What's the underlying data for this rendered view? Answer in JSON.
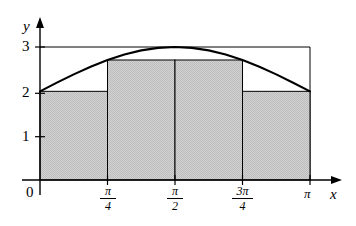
{
  "figure": {
    "kind": "riemann-sum-diagram",
    "axis_labels": {
      "x": "x",
      "y": "y"
    },
    "origin_label": "0",
    "y_ticks": [
      {
        "value": 3,
        "label": "3"
      },
      {
        "value": 2,
        "label": "2"
      },
      {
        "value": 1,
        "label": "1"
      }
    ],
    "x_ticks": [
      {
        "value": 0,
        "label": "0",
        "style": "plain"
      },
      {
        "value": 0.7853981634,
        "num": "π",
        "den": "4",
        "style": "fraction"
      },
      {
        "value": 1.5707963268,
        "num": "π",
        "den": "2",
        "style": "fraction"
      },
      {
        "value": 2.3561944902,
        "num": "3π",
        "den": "4",
        "style": "fraction"
      },
      {
        "value": 3.1415926536,
        "label": "π",
        "style": "plain"
      }
    ],
    "colors": {
      "fill": "#c8c8c8",
      "stroke": "#000000",
      "curve": "#000000",
      "thin_line": "#000000",
      "background": "#ffffff"
    }
  },
  "chart_data": {
    "type": "area",
    "title": "",
    "xlabel": "x",
    "ylabel": "y",
    "xlim": [
      0,
      3.1415926536
    ],
    "ylim": [
      0,
      3
    ],
    "grid": false,
    "legend": "none",
    "curve": {
      "name": "f(x) = 2 + sin(x)",
      "expression": "2 + sin(x)",
      "x": [
        0,
        0.19635,
        0.3927,
        0.58905,
        0.7854,
        0.98175,
        1.1781,
        1.37445,
        1.5708,
        1.76715,
        1.9635,
        2.15985,
        2.3562,
        2.55255,
        2.7489,
        2.94525,
        3.14159
      ],
      "y": [
        2.0,
        2.195,
        2.383,
        2.556,
        2.707,
        2.831,
        2.924,
        2.981,
        3.0,
        2.981,
        2.924,
        2.831,
        2.707,
        2.556,
        2.383,
        2.195,
        2.0
      ]
    },
    "rectangles": {
      "kind": "lower-riemann-sum",
      "n": 4,
      "dx": 0.7853981634,
      "edges": [
        0,
        0.7853981634,
        1.5707963268,
        2.3561944902,
        3.1415926536
      ],
      "edge_labels": [
        "0",
        "π/4",
        "π/2",
        "3π/4",
        "π"
      ],
      "heights": [
        2.0,
        2.707,
        2.707,
        2.0
      ],
      "sum_area": 3.6993
    },
    "reference_lines": [
      {
        "type": "horizontal",
        "value": 3,
        "label": "3"
      }
    ]
  }
}
